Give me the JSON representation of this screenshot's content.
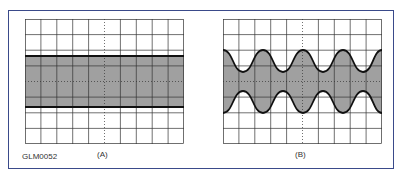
{
  "figure_id": "GLM0052",
  "panels": [
    {
      "label": "(A)",
      "type": "unmodulated-carrier",
      "description": "Constant-amplitude band"
    },
    {
      "label": "(B)",
      "type": "amplitude-modulated",
      "description": "Sinusoidal envelope, 4 cycles"
    }
  ],
  "grid": {
    "columns": 10,
    "rows": 8
  },
  "colors": {
    "frame": "#3a4a8a",
    "grid": "#333333",
    "fill": "#a0a0a0",
    "trace": "#111111"
  }
}
